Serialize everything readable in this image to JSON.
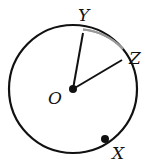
{
  "figure": {
    "type": "circle-with-radii",
    "center": {
      "label": "O",
      "x": 73,
      "y": 89
    },
    "radius": 64,
    "points": [
      {
        "label": "Y",
        "x": 83,
        "y": 33,
        "label_x": 78,
        "label_y": 21
      },
      {
        "label": "Z",
        "x": 122,
        "y": 60,
        "label_x": 129,
        "label_y": 64
      },
      {
        "label": "X",
        "x": 105,
        "y": 139,
        "label_x": 112,
        "label_y": 159
      }
    ],
    "center_label": {
      "text": "O",
      "x": 48,
      "y": 104
    },
    "segments": [
      "OY",
      "OZ"
    ],
    "highlighted_arc": {
      "from": "Y",
      "to": "Z",
      "color": "#888888"
    },
    "colors": {
      "stroke": "#111111",
      "arc_highlight": "#888888"
    }
  }
}
